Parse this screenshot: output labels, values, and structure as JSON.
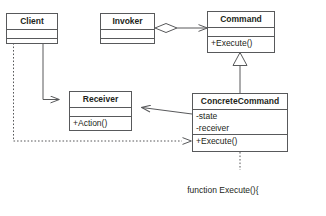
{
  "diagram": {
    "stroke_color": "#58595b",
    "text_color": "#231f20",
    "background": "#ffffff"
  },
  "classes": {
    "client": {
      "name": "Client",
      "attributes": "",
      "operations": ""
    },
    "invoker": {
      "name": "Invoker",
      "attributes": "",
      "operations": ""
    },
    "command": {
      "name": "Command",
      "attributes": "",
      "operations": "+Execute()"
    },
    "receiver": {
      "name": "Receiver",
      "attributes": "",
      "operations": "+Action()"
    },
    "concrete_command": {
      "name": "ConcreteCommand",
      "attribute_1": "-state",
      "attribute_2": "-receiver",
      "operations": "+Execute()"
    }
  },
  "note": {
    "line_1": "function Execute(){",
    "line_2": "receiver.Action()",
    "line_3": "}"
  },
  "relationships": [
    {
      "name": "invoker-to-command-aggregation",
      "from": "Invoker",
      "to": "Command",
      "type": "aggregation"
    },
    {
      "name": "concretecommand-to-command-generalization",
      "from": "ConcreteCommand",
      "to": "Command",
      "type": "generalization"
    },
    {
      "name": "concretecommand-to-receiver-association",
      "from": "ConcreteCommand",
      "to": "Receiver",
      "type": "association"
    },
    {
      "name": "client-to-receiver-association",
      "from": "Client",
      "to": "Receiver",
      "type": "association"
    },
    {
      "name": "client-to-concretecommand-dependency",
      "from": "Client",
      "to": "ConcreteCommand",
      "type": "dependency"
    },
    {
      "name": "concretecommand-note-anchor",
      "from": "ConcreteCommand",
      "to": "Note",
      "type": "note-anchor"
    }
  ]
}
